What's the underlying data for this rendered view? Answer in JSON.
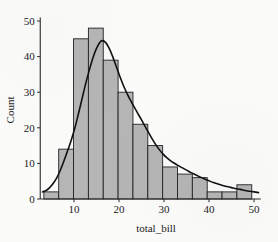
{
  "chart_data": {
    "type": "bar",
    "title": "",
    "subtitle": "",
    "xlabel": "total_bill",
    "ylabel": "Count",
    "xlim": [
      2.5,
      51.5
    ],
    "ylim": [
      0,
      51
    ],
    "grid": false,
    "legend": null,
    "bin_width": 3.3,
    "categories": [
      "3.3-6.6",
      "6.6-9.9",
      "9.9-13.2",
      "13.2-16.5",
      "16.5-19.8",
      "19.8-23.1",
      "23.1-26.4",
      "26.4-29.7",
      "29.7-33.0",
      "33.0-36.3",
      "36.3-39.6",
      "39.6-42.9",
      "42.9-46.2",
      "46.2-49.5"
    ],
    "bin_edges": [
      3.3,
      6.6,
      9.9,
      13.2,
      16.5,
      19.8,
      23.1,
      26.4,
      29.7,
      33.0,
      36.3,
      39.6,
      42.9,
      46.2,
      49.5
    ],
    "values": [
      2,
      14,
      45,
      48,
      39,
      30,
      21,
      15,
      9,
      7,
      6,
      2,
      2,
      4
    ],
    "xticks": [
      10,
      20,
      30,
      40,
      50
    ],
    "xtick_labels": [
      "10",
      "20",
      "30",
      "40",
      "50"
    ],
    "yticks": [
      0,
      10,
      20,
      30,
      40,
      50
    ],
    "ytick_labels": [
      "0",
      "10",
      "20",
      "30",
      "40",
      "50"
    ],
    "kde": {
      "name": "kde-curve",
      "peak_x": 16.0,
      "peak_y": 44.5,
      "points": [
        [
          3.0,
          2.0
        ],
        [
          3.8,
          2.4
        ],
        [
          4.6,
          3.2
        ],
        [
          5.4,
          4.4
        ],
        [
          6.2,
          6.0
        ],
        [
          7.0,
          8.2
        ],
        [
          7.8,
          10.8
        ],
        [
          8.6,
          13.6
        ],
        [
          9.4,
          16.6
        ],
        [
          10.2,
          20.0
        ],
        [
          11.0,
          24.0
        ],
        [
          11.8,
          28.2
        ],
        [
          12.6,
          32.4
        ],
        [
          13.4,
          36.2
        ],
        [
          14.2,
          39.6
        ],
        [
          15.0,
          42.3
        ],
        [
          15.8,
          44.1
        ],
        [
          16.3,
          44.5
        ],
        [
          17.0,
          44.0
        ],
        [
          17.8,
          42.4
        ],
        [
          18.6,
          40.0
        ],
        [
          19.4,
          37.2
        ],
        [
          20.2,
          34.4
        ],
        [
          21.0,
          31.8
        ],
        [
          21.8,
          29.6
        ],
        [
          22.6,
          27.6
        ],
        [
          23.4,
          25.8
        ],
        [
          24.2,
          24.0
        ],
        [
          25.0,
          22.2
        ],
        [
          25.8,
          20.4
        ],
        [
          26.6,
          18.6
        ],
        [
          27.4,
          16.8
        ],
        [
          28.2,
          15.2
        ],
        [
          29.0,
          13.8
        ],
        [
          29.8,
          12.6
        ],
        [
          30.6,
          11.6
        ],
        [
          31.4,
          10.8
        ],
        [
          32.2,
          10.1
        ],
        [
          33.0,
          9.5
        ],
        [
          34.0,
          8.8
        ],
        [
          35.0,
          8.1
        ],
        [
          36.0,
          7.4
        ],
        [
          37.0,
          6.8
        ],
        [
          38.0,
          6.2
        ],
        [
          39.0,
          5.6
        ],
        [
          40.0,
          5.1
        ],
        [
          41.0,
          4.6
        ],
        [
          42.0,
          4.2
        ],
        [
          43.0,
          3.8
        ],
        [
          44.0,
          3.5
        ],
        [
          45.0,
          3.2
        ],
        [
          46.0,
          2.9
        ],
        [
          47.0,
          2.7
        ],
        [
          48.0,
          2.4
        ],
        [
          49.0,
          2.2
        ],
        [
          50.0,
          2.0
        ],
        [
          51.0,
          1.8
        ]
      ]
    },
    "colors": {
      "bar_fill": "#b5b5b5",
      "bar_edge": "#232323",
      "kde_line": "#111111",
      "axis": "#2b2b2b",
      "text": "#1a1a1a",
      "background": "#fbfbfa"
    }
  }
}
